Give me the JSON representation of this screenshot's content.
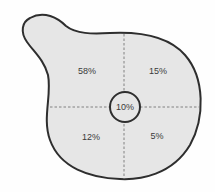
{
  "diagram": {
    "type": "quadrant-blob",
    "regions": {
      "top_left": "58%",
      "top_right": "15%",
      "bottom_left": "12%",
      "bottom_right": "5%",
      "center": "10%"
    },
    "colors": {
      "fill": "#e6e6e6",
      "outline": "#2e2e2e",
      "divider": "#777777"
    }
  }
}
